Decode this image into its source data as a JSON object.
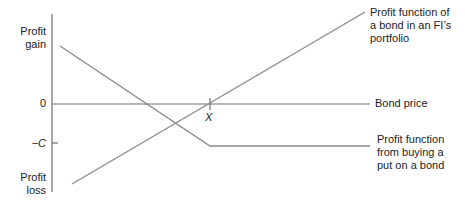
{
  "diagram": {
    "y_axis": {
      "top_label": "Profit\ngain",
      "bottom_label": "Profit\nloss",
      "zero_label": "0",
      "minus_c_label": "−C"
    },
    "x_axis": {
      "label": "Bond price",
      "strike_label": "X"
    },
    "series": [
      {
        "name": "Profit function of\na bond in an FI’s\nportfolio",
        "color": "#8a8a8a"
      },
      {
        "name": "Profit function\nfrom buying a\nput on a bond",
        "color": "#8a8a8a"
      }
    ],
    "colors": {
      "axis": "#6e6e6e",
      "line": "#8a8a8a",
      "text": "#222222"
    }
  }
}
